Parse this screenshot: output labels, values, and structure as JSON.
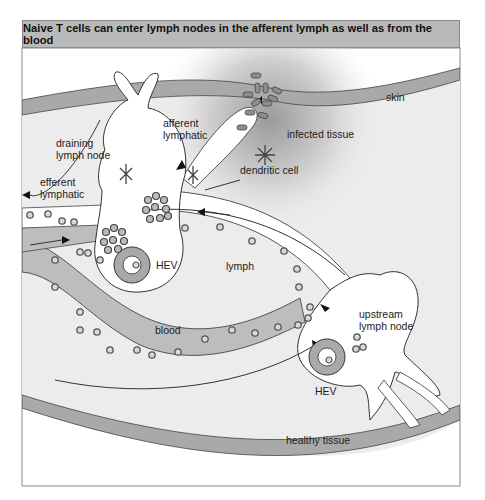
{
  "title": "Naive T cells can enter lymph nodes in the afferent lymph as well as from the blood",
  "labels": {
    "skin": "skin",
    "afferent_lymphatic_1": "afferent",
    "afferent_lymphatic_2": "lymphatic",
    "infected_tissue": "infected tissue",
    "draining_node_1": "draining",
    "draining_node_2": "lymph node",
    "dendritic_cell": "dendritic cell",
    "efferent_lymphatic_1": "efferent",
    "efferent_lymphatic_2": "lymphatic",
    "hev_left": "HEV",
    "lymph": "lymph",
    "blood": "blood",
    "upstream_node_1": "upstream",
    "upstream_node_2": "lymph node",
    "hev_right": "HEV",
    "healthy_tissue": "healthy tissue"
  },
  "colors": {
    "title_bar": "#b9b9b9",
    "tissue": "#ececec",
    "skin_band": "#a9a9a9",
    "blood_vessel": "#bdbdbd",
    "lymph_vessel": "#ffffff",
    "outline": "#333333"
  }
}
